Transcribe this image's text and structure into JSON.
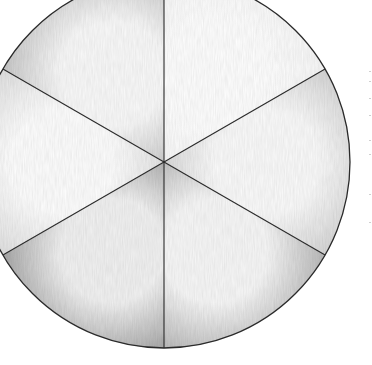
{
  "chart_data": {
    "type": "pie",
    "title": "",
    "categories": [
      "Slice 1",
      "Slice 2",
      "Slice 3",
      "Slice 4",
      "Slice 5",
      "Slice 6"
    ],
    "values": [
      1,
      1,
      1,
      1,
      1,
      1
    ],
    "percentages": [
      16.67,
      16.67,
      16.67,
      16.67,
      16.67,
      16.67
    ],
    "start_angle_deg": -90,
    "direction": "clockwise",
    "legend": null,
    "style": "hand-drawn pencil shading, grayscale",
    "slice_shades": [
      "#f7f7f7",
      "#d2d2d2",
      "#b5b5b5",
      "#a3a3a3",
      "#dedede",
      "#c4c4c4"
    ],
    "slice_highlights": [
      "#ffffff",
      "#fbfbfb",
      "#f8f8f8",
      "#f2f2f2",
      "#fefefe",
      "#fafafa"
    ],
    "outline_color": "#2a2a2a",
    "center": [
      164,
      162
    ],
    "radius": 186
  }
}
